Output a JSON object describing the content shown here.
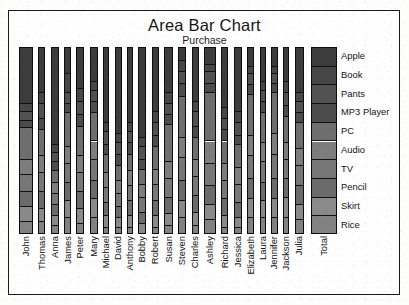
{
  "chart_data": {
    "type": "bar",
    "title": "Area Bar Chart",
    "subtitle": "Purchase",
    "xlabel": "",
    "ylabel": "",
    "stacked": "100%",
    "grid": false,
    "legend_position": "right",
    "legend_axis_label": "Total",
    "categories": [
      "John",
      "Thomas",
      "Anna",
      "James",
      "Peter",
      "Mary",
      "Michael",
      "David",
      "Anthony",
      "Bobby",
      "Robert",
      "Susan",
      "Steven",
      "Charles",
      "Ashley",
      "Richard",
      "Jessica",
      "Elizabeth",
      "Laura",
      "Jennifer",
      "Jackson",
      "Julia"
    ],
    "series_names": [
      "Apple",
      "Book",
      "Pants",
      "MP3 Player",
      "PC",
      "Audio",
      "TV",
      "Pencil",
      "Skirt",
      "Rice"
    ],
    "series_colors": [
      "#3c3c3c",
      "#474747",
      "#525252",
      "#4c4c4c",
      "#6e6e6e",
      "#7d7d7d",
      "#777777",
      "#6b6b6b",
      "#8a8a8a",
      "#828282"
    ],
    "series": [
      {
        "name": "Apple",
        "values": [
          30,
          24,
          52,
          14,
          22,
          18,
          40,
          46,
          40,
          48,
          34,
          24,
          7,
          29,
          9,
          32,
          34,
          10,
          18,
          10,
          18,
          24
        ]
      },
      {
        "name": "Book",
        "values": [
          4,
          6,
          4,
          10,
          7,
          5,
          5,
          5,
          5,
          5,
          6,
          6,
          6,
          5,
          4,
          6,
          6,
          4,
          5,
          4,
          6,
          5
        ]
      },
      {
        "name": "Pants",
        "values": [
          5,
          8,
          5,
          6,
          7,
          6,
          7,
          6,
          6,
          7,
          7,
          6,
          6,
          8,
          6,
          6,
          7,
          6,
          6,
          5,
          7,
          6
        ]
      },
      {
        "name": "MP3 Player",
        "values": [
          4,
          6,
          5,
          5,
          6,
          6,
          5,
          6,
          6,
          5,
          6,
          5,
          7,
          6,
          5,
          6,
          5,
          5,
          6,
          5,
          6,
          5
        ]
      },
      {
        "name": "PC",
        "values": [
          17,
          14,
          6,
          18,
          16,
          15,
          10,
          8,
          9,
          8,
          12,
          20,
          22,
          12,
          26,
          12,
          12,
          22,
          16,
          22,
          14,
          14
        ]
      },
      {
        "name": "Audio",
        "values": [
          8,
          9,
          6,
          9,
          9,
          10,
          8,
          7,
          8,
          7,
          8,
          9,
          11,
          9,
          12,
          9,
          9,
          11,
          10,
          11,
          9,
          9
        ]
      },
      {
        "name": "TV",
        "values": [
          9,
          10,
          6,
          10,
          10,
          11,
          8,
          7,
          8,
          8,
          9,
          10,
          12,
          10,
          12,
          10,
          10,
          12,
          11,
          13,
          10,
          11
        ]
      },
      {
        "name": "Pencil",
        "values": [
          8,
          9,
          6,
          10,
          9,
          10,
          7,
          6,
          8,
          6,
          8,
          9,
          11,
          9,
          10,
          9,
          8,
          11,
          10,
          11,
          10,
          10
        ]
      },
      {
        "name": "Skirt",
        "values": [
          8,
          7,
          5,
          9,
          8,
          10,
          6,
          5,
          6,
          6,
          6,
          6,
          9,
          7,
          8,
          6,
          5,
          10,
          9,
          10,
          11,
          8
        ]
      },
      {
        "name": "Rice",
        "values": [
          7,
          7,
          5,
          9,
          6,
          9,
          4,
          4,
          4,
          0,
          4,
          5,
          9,
          5,
          8,
          4,
          4,
          9,
          9,
          9,
          9,
          8
        ]
      }
    ],
    "bar_widths": [
      14,
      7,
      8,
      7,
      8,
      8,
      6,
      7,
      6,
      8,
      7,
      9,
      8,
      7,
      12,
      7,
      8,
      7,
      6,
      7,
      6,
      9
    ]
  },
  "legend": {
    "items": [
      {
        "label": "Apple",
        "color": "#3c3c3c"
      },
      {
        "label": "Book",
        "color": "#474747"
      },
      {
        "label": "Pants",
        "color": "#525252"
      },
      {
        "label": "MP3 Player",
        "color": "#4c4c4c"
      },
      {
        "label": "PC",
        "color": "#6e6e6e"
      },
      {
        "label": "Audio",
        "color": "#7d7d7d"
      },
      {
        "label": "TV",
        "color": "#777777"
      },
      {
        "label": "Pencil",
        "color": "#6b6b6b"
      },
      {
        "label": "Skirt",
        "color": "#8a8a8a"
      },
      {
        "label": "Rice",
        "color": "#828282"
      }
    ],
    "axis_label": "Total"
  }
}
